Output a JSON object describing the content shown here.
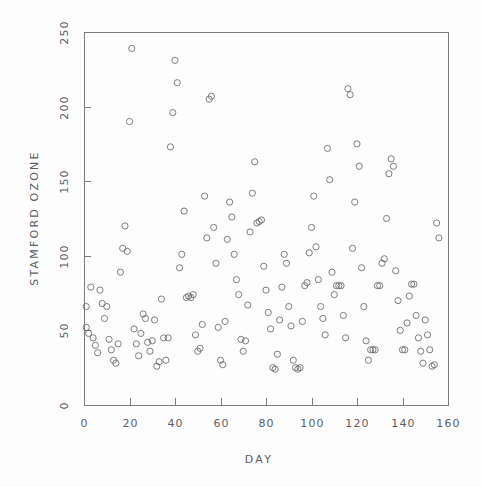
{
  "chart_data": {
    "type": "scatter",
    "title": "",
    "xlabel": "DAY",
    "ylabel": "STAMFORD OZONE",
    "xlim": [
      0,
      160
    ],
    "ylim": [
      0,
      250
    ],
    "xticks": [
      0,
      20,
      40,
      60,
      80,
      100,
      120,
      140,
      160
    ],
    "yticks": [
      0,
      50,
      100,
      150,
      200,
      250
    ],
    "grid": false,
    "legend": null,
    "marker": "open-circle",
    "marker_color": "#6e6e76",
    "axis_color": "#7a7a80",
    "text_color": "#5d5d66",
    "background_color": "#fdfdfd",
    "n_points": 136,
    "points": [
      [
        1,
        66
      ],
      [
        1,
        52
      ],
      [
        2,
        48
      ],
      [
        3,
        79
      ],
      [
        4,
        45
      ],
      [
        5,
        40
      ],
      [
        6,
        35
      ],
      [
        7,
        77
      ],
      [
        8,
        68
      ],
      [
        9,
        58
      ],
      [
        10,
        66
      ],
      [
        11,
        44
      ],
      [
        12,
        37
      ],
      [
        13,
        30
      ],
      [
        14,
        28
      ],
      [
        15,
        41
      ],
      [
        16,
        89
      ],
      [
        17,
        105
      ],
      [
        18,
        120
      ],
      [
        19,
        103
      ],
      [
        20,
        190
      ],
      [
        21,
        239
      ],
      [
        22,
        51
      ],
      [
        23,
        41
      ],
      [
        24,
        33
      ],
      [
        25,
        48
      ],
      [
        26,
        61
      ],
      [
        27,
        58
      ],
      [
        28,
        42
      ],
      [
        29,
        36
      ],
      [
        30,
        43
      ],
      [
        31,
        57
      ],
      [
        32,
        26
      ],
      [
        33,
        29
      ],
      [
        34,
        71
      ],
      [
        35,
        45
      ],
      [
        36,
        30
      ],
      [
        37,
        45
      ],
      [
        38,
        173
      ],
      [
        39,
        196
      ],
      [
        40,
        231
      ],
      [
        41,
        216
      ],
      [
        42,
        92
      ],
      [
        43,
        101
      ],
      [
        44,
        130
      ],
      [
        45,
        72
      ],
      [
        46,
        73
      ],
      [
        47,
        72
      ],
      [
        48,
        74
      ],
      [
        49,
        47
      ],
      [
        50,
        36
      ],
      [
        51,
        38
      ],
      [
        52,
        54
      ],
      [
        53,
        140
      ],
      [
        54,
        112
      ],
      [
        55,
        205
      ],
      [
        56,
        207
      ],
      [
        57,
        119
      ],
      [
        58,
        95
      ],
      [
        59,
        52
      ],
      [
        60,
        30
      ],
      [
        61,
        27
      ],
      [
        62,
        56
      ],
      [
        63,
        111
      ],
      [
        64,
        136
      ],
      [
        65,
        126
      ],
      [
        66,
        101
      ],
      [
        67,
        84
      ],
      [
        68,
        74
      ],
      [
        69,
        44
      ],
      [
        70,
        36
      ],
      [
        71,
        43
      ],
      [
        72,
        67
      ],
      [
        73,
        116
      ],
      [
        74,
        142
      ],
      [
        75,
        163
      ],
      [
        76,
        122
      ],
      [
        77,
        123
      ],
      [
        78,
        124
      ],
      [
        79,
        93
      ],
      [
        80,
        77
      ],
      [
        81,
        62
      ],
      [
        82,
        51
      ],
      [
        83,
        25
      ],
      [
        84,
        24
      ],
      [
        85,
        34
      ],
      [
        86,
        57
      ],
      [
        87,
        79
      ],
      [
        88,
        101
      ],
      [
        89,
        95
      ],
      [
        90,
        66
      ],
      [
        91,
        53
      ],
      [
        92,
        30
      ],
      [
        93,
        25
      ],
      [
        94,
        24
      ],
      [
        95,
        25
      ],
      [
        96,
        56
      ],
      [
        97,
        80
      ],
      [
        98,
        82
      ],
      [
        99,
        102
      ],
      [
        100,
        119
      ],
      [
        101,
        140
      ],
      [
        102,
        106
      ],
      [
        103,
        84
      ],
      [
        104,
        66
      ],
      [
        105,
        58
      ],
      [
        106,
        47
      ],
      [
        107,
        172
      ],
      [
        108,
        151
      ],
      [
        109,
        89
      ],
      [
        110,
        74
      ],
      [
        111,
        80
      ],
      [
        112,
        80
      ],
      [
        113,
        80
      ],
      [
        114,
        60
      ],
      [
        115,
        45
      ],
      [
        116,
        212
      ],
      [
        117,
        208
      ],
      [
        118,
        105
      ],
      [
        119,
        136
      ],
      [
        120,
        175
      ],
      [
        121,
        160
      ],
      [
        122,
        92
      ],
      [
        123,
        66
      ],
      [
        124,
        43
      ],
      [
        125,
        30
      ],
      [
        126,
        37
      ],
      [
        127,
        37
      ],
      [
        128,
        37
      ],
      [
        129,
        80
      ],
      [
        130,
        80
      ],
      [
        131,
        95
      ],
      [
        132,
        98
      ],
      [
        133,
        125
      ],
      [
        134,
        155
      ],
      [
        135,
        165
      ],
      [
        136,
        160
      ],
      [
        137,
        90
      ],
      [
        138,
        70
      ],
      [
        139,
        50
      ],
      [
        140,
        37
      ],
      [
        141,
        37
      ],
      [
        142,
        55
      ],
      [
        143,
        73
      ],
      [
        144,
        81
      ],
      [
        145,
        81
      ],
      [
        146,
        60
      ],
      [
        147,
        45
      ],
      [
        148,
        36
      ],
      [
        149,
        28
      ],
      [
        150,
        57
      ],
      [
        151,
        47
      ],
      [
        152,
        37
      ],
      [
        153,
        26
      ],
      [
        154,
        27
      ],
      [
        155,
        122
      ],
      [
        156,
        112
      ]
    ]
  }
}
